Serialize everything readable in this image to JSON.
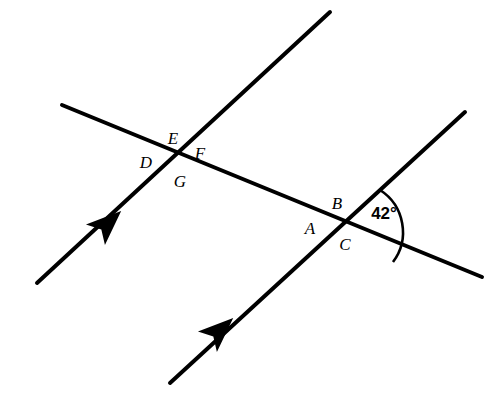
{
  "figure": {
    "type": "geometry-diagram",
    "background_color": "#ffffff",
    "stroke_color": "#000000"
  },
  "angle": {
    "value": "42",
    "unit": "°",
    "label": "42°",
    "vertex": "right-intersection"
  },
  "labels": [
    {
      "text": "E",
      "x": 173,
      "y": 144
    },
    {
      "text": "F",
      "x": 200,
      "y": 159
    },
    {
      "text": "D",
      "x": 146,
      "y": 168
    },
    {
      "text": "G",
      "x": 180,
      "y": 187
    },
    {
      "text": "B",
      "x": 337,
      "y": 209
    },
    {
      "text": "A",
      "x": 310,
      "y": 234
    },
    {
      "text": "C",
      "x": 345,
      "y": 250
    }
  ],
  "lines": [
    {
      "name": "transversal",
      "x1": 62,
      "y1": 105,
      "x2": 482,
      "y2": 277,
      "arrow": false
    },
    {
      "name": "parallel-line-left",
      "x1": 37,
      "y1": 283,
      "x2": 330,
      "y2": 12,
      "arrow": true
    },
    {
      "name": "parallel-line-right",
      "x1": 170,
      "y1": 383,
      "x2": 465,
      "y2": 112,
      "arrow": true
    }
  ],
  "intersections": [
    {
      "name": "left-intersection",
      "x": 176,
      "y": 157
    },
    {
      "name": "right-intersection",
      "x": 344,
      "y": 228
    }
  ],
  "arrow_marks": [
    {
      "name": "parallel-arrow-left",
      "x": 105,
      "y": 226,
      "angle": -42.7
    },
    {
      "name": "parallel-arrow-right",
      "x": 217,
      "y": 333,
      "angle": -42.6
    }
  ]
}
